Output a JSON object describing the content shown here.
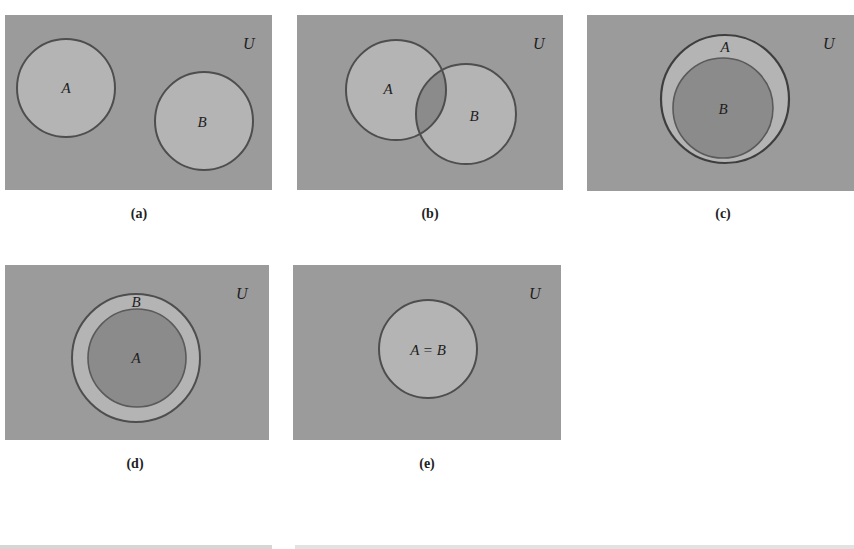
{
  "colors": {
    "universe": "#9b9b9b",
    "set_fill": "#b4b4b4",
    "inner_fill": "#8b8b8b",
    "outline": "#4e4e4e",
    "bottom_strip": "#d8d8d8"
  },
  "universe_label": "U",
  "panels": [
    {
      "id": "a",
      "caption": "(a)",
      "description": "A and B disjoint",
      "rect": {
        "x": 5,
        "y": 15,
        "w": 267,
        "h": 175
      },
      "u_label_pos": {
        "x": 243,
        "y": 49
      },
      "sets": [
        {
          "label": "A",
          "cx": 66,
          "cy": 88,
          "r": 49,
          "fill": "set_fill"
        },
        {
          "label": "B",
          "cx": 204,
          "cy": 121,
          "r": 49,
          "fill": "set_fill"
        }
      ],
      "caption_pos": {
        "x": 139,
        "y": 218
      }
    },
    {
      "id": "b",
      "caption": "(b)",
      "description": "A and B overlapping",
      "rect": {
        "x": 297,
        "y": 15,
        "w": 266,
        "h": 175
      },
      "u_label_pos": {
        "x": 533,
        "y": 49
      },
      "sets": [
        {
          "label": "A",
          "cx": 396,
          "cy": 90,
          "r": 50,
          "fill": "set_fill"
        },
        {
          "label": "B",
          "cx": 466,
          "cy": 114,
          "r": 50,
          "fill": "set_fill"
        }
      ],
      "caption_pos": {
        "x": 430,
        "y": 218
      }
    },
    {
      "id": "c",
      "caption": "(c)",
      "description": "B subset of A",
      "rect": {
        "x": 587,
        "y": 15,
        "w": 267,
        "h": 176
      },
      "u_label_pos": {
        "x": 828,
        "y": 49
      },
      "sets": [
        {
          "label": "A",
          "cx": 725,
          "cy": 99,
          "r": 64,
          "fill": "set_fill",
          "label_x": 726,
          "label_y": 52
        },
        {
          "label": "B",
          "cx": 723,
          "cy": 108,
          "r": 50,
          "fill": "inner_fill"
        }
      ],
      "caption_pos": {
        "x": 722,
        "y": 218
      }
    },
    {
      "id": "d",
      "caption": "(d)",
      "description": "A subset of B",
      "rect": {
        "x": 5,
        "y": 265,
        "w": 264,
        "h": 175
      },
      "u_label_pos": {
        "x": 241,
        "y": 298
      },
      "sets": [
        {
          "label": "B",
          "cx": 136,
          "cy": 358,
          "r": 64,
          "fill": "set_fill",
          "label_x": 136,
          "label_y": 307
        },
        {
          "label": "A",
          "cx": 137,
          "cy": 358,
          "r": 49,
          "fill": "inner_fill"
        }
      ],
      "caption_pos": {
        "x": 135,
        "y": 468
      }
    },
    {
      "id": "e",
      "caption": "(e)",
      "description": "A equals B",
      "rect": {
        "x": 293,
        "y": 265,
        "w": 268,
        "h": 175
      },
      "u_label_pos": {
        "x": 534,
        "y": 298
      },
      "sets": [
        {
          "label": "A = B",
          "cx": 428,
          "cy": 349,
          "r": 49,
          "fill": "set_fill"
        }
      ],
      "caption_pos": {
        "x": 427,
        "y": 468
      }
    }
  ]
}
